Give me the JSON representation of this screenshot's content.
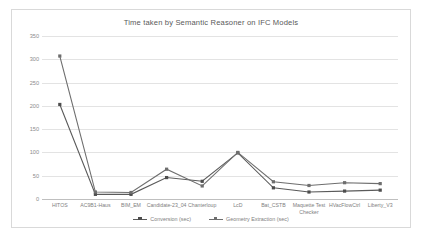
{
  "chart_data": {
    "type": "line",
    "title": "Time taken by Semantic Reasoner on IFC Models",
    "xlabel": "",
    "ylabel": "",
    "ylim": [
      0,
      350
    ],
    "yticks": [
      0,
      50,
      100,
      150,
      200,
      250,
      300,
      350
    ],
    "grid": "horizontal",
    "legend_position": "bottom",
    "categories": [
      "HITOS",
      "AC9B1-Haus",
      "BIM_EM",
      "Candidate-23_04",
      "Chanterloup",
      "LcD",
      "Bat_CSTB",
      "Maquette Test Checker",
      "HVacFlowCtrl",
      "Liberty_V3"
    ],
    "series": [
      {
        "name": "Conversion (sec)",
        "values": [
          203,
          10,
          10,
          46,
          38,
          99,
          24,
          15,
          17,
          19
        ]
      },
      {
        "name": "Geometry Extraction (sec)",
        "values": [
          307,
          15,
          14,
          64,
          28,
          100,
          37,
          29,
          35,
          33
        ]
      }
    ]
  }
}
